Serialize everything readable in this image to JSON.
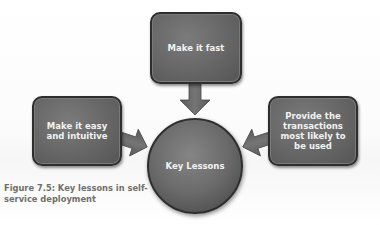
{
  "diagram": {
    "center": {
      "label": "Key Lessons"
    },
    "nodes": [
      {
        "id": "top",
        "label": "Make it fast"
      },
      {
        "id": "left",
        "label": "Make it easy and intuitive"
      },
      {
        "id": "right",
        "label": "Provide the transactions most likely to be used"
      }
    ],
    "edges": [
      {
        "from": "top",
        "to": "center",
        "direction": "down"
      },
      {
        "from": "left",
        "to": "center",
        "direction": "right"
      },
      {
        "from": "right",
        "to": "center",
        "direction": "left"
      }
    ],
    "caption": "Figure 7.5: Key lessons in self-service deployment"
  },
  "colors": {
    "shape_fill": "#666666",
    "shape_border": "#2e2e2e",
    "shape_text": "#f2f2f2",
    "caption_text": "#6f6f6f",
    "background": "#ffffff"
  }
}
